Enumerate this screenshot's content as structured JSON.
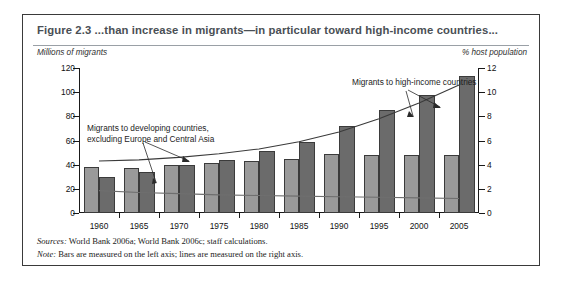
{
  "figure": {
    "title": "Figure 2.3  ...than increase in migrants—in particular toward high-income countries...",
    "sources_label": "Sources:",
    "sources_text": " World Bank 2006a; World Bank 2006c; staff calculations.",
    "note_label": "Note:",
    "note_text": " Bars are measured on the left axis; lines are measured on the right axis."
  },
  "chart_data": {
    "type": "bar",
    "title": "Figure 2.3  ...than increase in migrants—in particular toward high-income countries...",
    "xlabel": "",
    "ylabel": "Millions of migrants",
    "y2label": "% host population",
    "ylim": [
      0,
      120
    ],
    "y2lim": [
      0,
      12
    ],
    "yticks": [
      0,
      20,
      40,
      60,
      80,
      100,
      120
    ],
    "y2ticks": [
      0,
      2,
      4,
      6,
      8,
      10,
      12
    ],
    "grid": false,
    "categories": [
      "1960",
      "1965",
      "1970",
      "1975",
      "1980",
      "1985",
      "1990",
      "1995",
      "2000",
      "2005"
    ],
    "series": [
      {
        "name": "Migrants to developing countries, excluding Europe and Central Asia",
        "type": "bar",
        "axis": "left",
        "color": "#9a9a9a",
        "values": [
          38,
          37,
          40,
          41,
          43,
          45,
          49,
          48,
          48,
          48
        ]
      },
      {
        "name": "Migrants to high-income countries",
        "type": "bar",
        "axis": "left",
        "color": "#6b6b6b",
        "values": [
          30,
          34,
          40,
          44,
          51,
          59,
          72,
          85,
          98,
          113
        ]
      },
      {
        "name": "Migrants to high-income countries (% host population)",
        "type": "line",
        "axis": "right",
        "color": "#3a3a3a",
        "values": [
          4.3,
          4.4,
          4.6,
          4.9,
          5.3,
          5.9,
          6.7,
          7.8,
          9.1,
          10.6
        ]
      },
      {
        "name": "Migrants to developing countries, excluding Europe and Central Asia (% host population)",
        "type": "line",
        "axis": "right",
        "color": "#6f6f6f",
        "values": [
          1.85,
          1.7,
          1.6,
          1.5,
          1.45,
          1.4,
          1.35,
          1.3,
          1.25,
          1.2
        ]
      }
    ],
    "annotations": [
      {
        "text_line1": "Migrants to developing countries,",
        "text_line2": "excluding Europe and Central Asia"
      },
      {
        "text_line1": "Migrants to high-income countries",
        "text_line2": ""
      }
    ]
  },
  "axes": {
    "left_title": "Millions of migrants",
    "right_title": "% host population"
  }
}
